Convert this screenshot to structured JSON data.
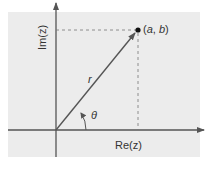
{
  "diagram": {
    "point_label": "(a, b)",
    "point_label_a": "a",
    "point_label_b": "b",
    "x_axis_label": "Re(z)",
    "y_axis_label": "Im(z)",
    "radius_label": "r",
    "angle_label": "θ",
    "colors": {
      "background_panel": "#ececec",
      "axis": "#555555",
      "vector": "#555555",
      "dashed": "#777777",
      "point": "#111111",
      "text": "#333333"
    }
  }
}
